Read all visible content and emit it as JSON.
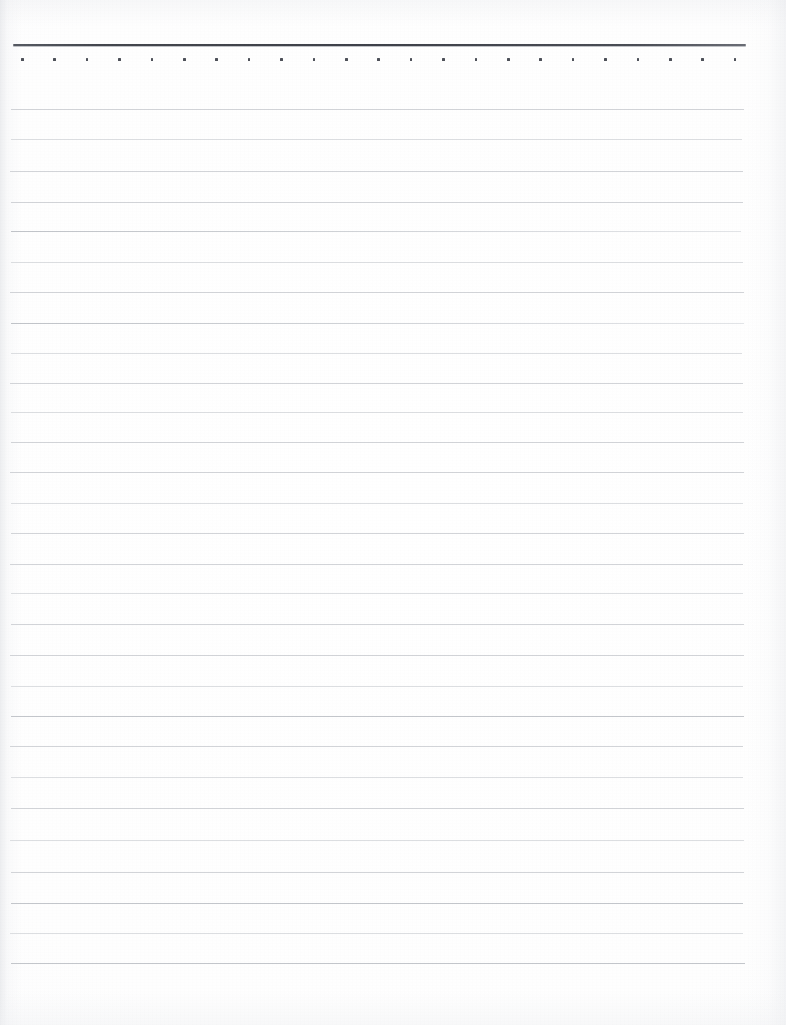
{
  "document": {
    "kind": "scanned-ruled-notepad-page",
    "title": "Blank ruled notepad page",
    "content_text": "",
    "page_width": 786,
    "page_height": 1025,
    "paper_color": "#ffffff",
    "is_blank": "true"
  },
  "header_rule": {
    "label": "header rule",
    "color": "#43464d",
    "x": 13,
    "y": 44,
    "width": 733,
    "thickness": 2
  },
  "dot_row": {
    "label": "perforation dot row",
    "color": "#4d5058",
    "y": 58,
    "start_x": 21,
    "spacing": 32.4,
    "count": 23,
    "size": 2.6
  },
  "ruled_lines": {
    "label": "ruled writing lines",
    "color": "#d2d4d8",
    "count": 29,
    "spacing": 30.5,
    "first_y": 109,
    "last_y": 963,
    "items": [
      {
        "y": 109,
        "x": 11,
        "width": 733,
        "weight": "normal"
      },
      {
        "y": 139,
        "x": 11,
        "width": 731,
        "weight": "faint"
      },
      {
        "y": 171,
        "x": 10,
        "width": 733,
        "weight": "normal"
      },
      {
        "y": 202,
        "x": 11,
        "width": 732,
        "weight": "normal"
      },
      {
        "y": 231,
        "x": 11,
        "width": 730,
        "weight": "grad"
      },
      {
        "y": 262,
        "x": 11,
        "width": 732,
        "weight": "faint"
      },
      {
        "y": 292,
        "x": 10,
        "width": 734,
        "weight": "normal"
      },
      {
        "y": 323,
        "x": 11,
        "width": 733,
        "weight": "grad"
      },
      {
        "y": 353,
        "x": 11,
        "width": 731,
        "weight": "faint"
      },
      {
        "y": 383,
        "x": 10,
        "width": 733,
        "weight": "normal"
      },
      {
        "y": 412,
        "x": 11,
        "width": 732,
        "weight": "faint"
      },
      {
        "y": 442,
        "x": 11,
        "width": 733,
        "weight": "normal"
      },
      {
        "y": 472,
        "x": 10,
        "width": 734,
        "weight": "normal"
      },
      {
        "y": 503,
        "x": 11,
        "width": 732,
        "weight": "faint"
      },
      {
        "y": 533,
        "x": 11,
        "width": 733,
        "weight": "normal"
      },
      {
        "y": 564,
        "x": 10,
        "width": 733,
        "weight": "normal"
      },
      {
        "y": 593,
        "x": 11,
        "width": 732,
        "weight": "faint"
      },
      {
        "y": 624,
        "x": 11,
        "width": 733,
        "weight": "normal"
      },
      {
        "y": 655,
        "x": 10,
        "width": 734,
        "weight": "normal"
      },
      {
        "y": 686,
        "x": 11,
        "width": 732,
        "weight": "faint"
      },
      {
        "y": 716,
        "x": 11,
        "width": 733,
        "weight": "strong"
      },
      {
        "y": 746,
        "x": 10,
        "width": 733,
        "weight": "normal"
      },
      {
        "y": 777,
        "x": 11,
        "width": 732,
        "weight": "faint"
      },
      {
        "y": 808,
        "x": 11,
        "width": 733,
        "weight": "normal"
      },
      {
        "y": 840,
        "x": 10,
        "width": 734,
        "weight": "faint"
      },
      {
        "y": 872,
        "x": 11,
        "width": 733,
        "weight": "normal"
      },
      {
        "y": 903,
        "x": 11,
        "width": 732,
        "weight": "strong"
      },
      {
        "y": 933,
        "x": 10,
        "width": 733,
        "weight": "faint"
      },
      {
        "y": 963,
        "x": 11,
        "width": 734,
        "weight": "strong"
      }
    ]
  },
  "margins": {
    "top_blank_height": 44,
    "bottom_blank_height": 62,
    "left_edge": 10,
    "right_edge": 746
  }
}
